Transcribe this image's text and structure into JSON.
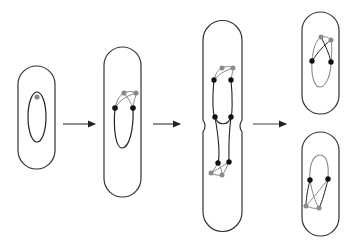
{
  "diagram": {
    "type": "process-flow",
    "stages": [
      {
        "id": "stage-1",
        "cells": 1,
        "description": "cell with single chromosome, one origin"
      },
      {
        "id": "stage-2",
        "cells": 1,
        "description": "elongated cell, origins duplicated"
      },
      {
        "id": "stage-3",
        "cells": 1,
        "description": "constricting cell with two replicated chromosomes"
      },
      {
        "id": "stage-4",
        "cells": 2,
        "description": "two daughter cells"
      }
    ],
    "arrows": 3,
    "colors": {
      "outline": "#333333",
      "chromosome_old": "#222222",
      "chromosome_new": "#8a8a8a",
      "marker_black": "#111111",
      "marker_gray": "#8a8a8a",
      "background": "#ffffff"
    }
  }
}
